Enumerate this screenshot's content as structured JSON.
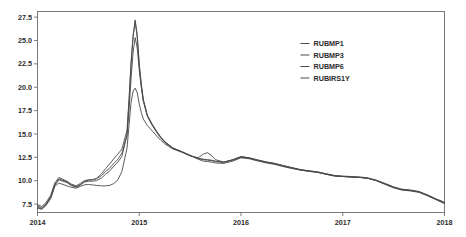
{
  "chart_data": {
    "type": "line",
    "title": "",
    "subtitle": "",
    "xlabel": "",
    "ylabel": "",
    "xlim": [
      2014.0,
      2018.0
    ],
    "ylim": [
      6.6,
      28.1
    ],
    "x_ticks": [
      "2014",
      "2015",
      "2016",
      "2017",
      "2018"
    ],
    "x_tick_values": [
      2014,
      2015,
      2016,
      2017,
      2018
    ],
    "y_ticks": [
      "7.5",
      "10.0",
      "12.5",
      "15.0",
      "17.5",
      "20.0",
      "22.5",
      "25.0",
      "27.5"
    ],
    "y_tick_values": [
      7.5,
      10.0,
      12.5,
      15.0,
      17.5,
      20.0,
      22.5,
      25.0,
      27.5
    ],
    "grid": false,
    "legend_position": "upper-right",
    "line_color": "#4a4a4a",
    "frame_color": "#6d6d6d",
    "x": [
      2014.0,
      2014.04,
      2014.08,
      2014.13,
      2014.17,
      2014.21,
      2014.25,
      2014.29,
      2014.33,
      2014.38,
      2014.42,
      2014.46,
      2014.5,
      2014.54,
      2014.58,
      2014.63,
      2014.67,
      2014.71,
      2014.75,
      2014.79,
      2014.83,
      2014.88,
      2014.9,
      2014.92,
      2014.94,
      2014.96,
      2014.98,
      2015.0,
      2015.02,
      2015.04,
      2015.08,
      2015.13,
      2015.17,
      2015.21,
      2015.25,
      2015.33,
      2015.42,
      2015.5,
      2015.58,
      2015.63,
      2015.67,
      2015.71,
      2015.75,
      2015.83,
      2015.92,
      2016.0,
      2016.08,
      2016.17,
      2016.25,
      2016.33,
      2016.42,
      2016.5,
      2016.58,
      2016.67,
      2016.75,
      2016.83,
      2016.92,
      2017.0,
      2017.08,
      2017.17,
      2017.25,
      2017.33,
      2017.42,
      2017.5,
      2017.58,
      2017.67,
      2017.75,
      2017.83,
      2017.92,
      2018.0
    ],
    "series": [
      {
        "name": "RUBMP1",
        "values": [
          7.3,
          7.1,
          7.45,
          8.3,
          9.6,
          10.2,
          10.05,
          9.85,
          9.55,
          9.35,
          9.55,
          9.85,
          9.95,
          9.95,
          10.0,
          10.3,
          10.7,
          11.05,
          11.55,
          12.0,
          12.6,
          15.0,
          18.5,
          22.5,
          25.4,
          27.2,
          25.6,
          22.5,
          20.4,
          18.7,
          17.0,
          16.0,
          15.3,
          14.7,
          14.2,
          13.5,
          13.1,
          12.7,
          12.35,
          12.25,
          12.2,
          12.15,
          12.05,
          11.95,
          12.25,
          12.6,
          12.45,
          12.2,
          12.0,
          11.85,
          11.6,
          11.4,
          11.2,
          11.05,
          10.95,
          10.75,
          10.55,
          10.45,
          10.4,
          10.35,
          10.25,
          10.0,
          9.6,
          9.25,
          9.05,
          8.95,
          8.8,
          8.45,
          8.0,
          7.65
        ]
      },
      {
        "name": "RUBMP3",
        "values": [
          7.45,
          7.25,
          7.6,
          8.45,
          9.75,
          10.35,
          10.15,
          9.95,
          9.65,
          9.45,
          9.7,
          10.0,
          10.1,
          10.1,
          10.2,
          10.55,
          11.0,
          11.35,
          11.85,
          12.3,
          12.95,
          14.8,
          17.6,
          21.0,
          23.8,
          25.3,
          24.2,
          21.8,
          20.0,
          18.5,
          16.9,
          15.9,
          15.2,
          14.6,
          14.1,
          13.45,
          13.05,
          12.65,
          12.45,
          12.85,
          13.0,
          12.7,
          12.25,
          12.0,
          12.2,
          12.5,
          12.4,
          12.15,
          11.95,
          11.8,
          11.55,
          11.35,
          11.15,
          11.0,
          10.9,
          10.7,
          10.5,
          10.45,
          10.4,
          10.35,
          10.25,
          10.05,
          9.7,
          9.35,
          9.1,
          9.0,
          8.85,
          8.5,
          8.05,
          7.7
        ]
      },
      {
        "name": "RUBMP6",
        "values": [
          7.2,
          7.0,
          7.35,
          8.2,
          9.5,
          10.1,
          9.95,
          9.8,
          9.5,
          9.3,
          9.55,
          9.9,
          10.05,
          10.1,
          10.25,
          10.75,
          11.3,
          11.8,
          12.35,
          12.85,
          13.4,
          15.4,
          18.9,
          22.8,
          25.6,
          27.0,
          25.3,
          22.3,
          20.2,
          18.6,
          16.9,
          15.9,
          15.25,
          14.65,
          14.15,
          13.5,
          13.1,
          12.7,
          12.4,
          12.3,
          12.25,
          12.2,
          12.1,
          12.0,
          12.25,
          12.55,
          12.45,
          12.2,
          12.0,
          11.85,
          11.6,
          11.4,
          11.2,
          11.05,
          10.95,
          10.75,
          10.55,
          10.5,
          10.45,
          10.4,
          10.3,
          10.05,
          9.65,
          9.3,
          9.05,
          8.95,
          8.8,
          8.45,
          8.0,
          7.6
        ]
      },
      {
        "name": "RUBIRS1Y",
        "values": [
          7.05,
          6.95,
          7.3,
          8.1,
          9.4,
          9.75,
          9.6,
          9.45,
          9.3,
          9.2,
          9.4,
          9.55,
          9.6,
          9.55,
          9.5,
          9.45,
          9.45,
          9.5,
          9.7,
          10.1,
          11.0,
          13.5,
          16.0,
          18.4,
          19.6,
          19.9,
          19.4,
          18.2,
          17.3,
          16.6,
          15.9,
          15.3,
          14.8,
          14.35,
          13.95,
          13.4,
          13.05,
          12.7,
          12.3,
          12.1,
          12.05,
          12.0,
          11.9,
          11.85,
          12.1,
          12.45,
          12.35,
          12.1,
          11.9,
          11.75,
          11.5,
          11.3,
          11.15,
          11.0,
          10.9,
          10.7,
          10.5,
          10.45,
          10.4,
          10.35,
          10.25,
          10.0,
          9.6,
          9.25,
          9.0,
          8.9,
          8.75,
          8.4,
          7.95,
          7.55
        ]
      }
    ]
  },
  "legend": {
    "items": [
      {
        "label": "RUBMP1"
      },
      {
        "label": "RUBMP3"
      },
      {
        "label": "RUBMP6"
      },
      {
        "label": "RUBIRS1Y"
      }
    ]
  }
}
